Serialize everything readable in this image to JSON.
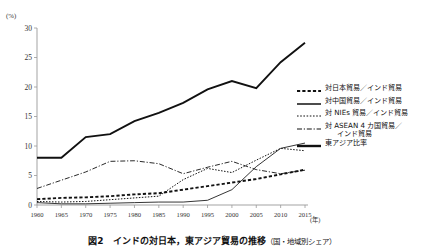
{
  "chart_data": {
    "type": "line",
    "title": "図2　インドの対日本，東アジア貿易の推移（国・地域別シェア）",
    "title_main": "図2　インドの対日本，東アジア貿易の推移",
    "title_sub": "（国・地域別シェア）",
    "xlabel": "(年)",
    "ylabel": "(%)",
    "unit_top": "(%)",
    "unit_right": "(年)",
    "grid": false,
    "legend_position": "right",
    "xlim": [
      1960,
      2015
    ],
    "ylim": [
      0,
      30
    ],
    "x": [
      1960,
      1965,
      1970,
      1975,
      1980,
      1985,
      1990,
      1995,
      2000,
      2005,
      2010,
      2015
    ],
    "xticks": [
      "1960",
      "1965",
      "1970",
      "1975",
      "1980",
      "1985",
      "1990",
      "1995",
      "2000",
      "2005",
      "2010",
      "2015"
    ],
    "yticks": [
      "0",
      "5",
      "10",
      "15",
      "20",
      "25",
      "30"
    ],
    "series": [
      {
        "name": "対日本貿易/インド貿易",
        "style": "dashed-heavy",
        "values": [
          1.0,
          1.2,
          1.3,
          1.5,
          1.8,
          2.0,
          2.6,
          3.2,
          3.8,
          4.4,
          5.2,
          6.0
        ]
      },
      {
        "name": "対中国貿易/インド貿易",
        "style": "solid-thin",
        "values": [
          0.4,
          0.2,
          0.2,
          0.3,
          0.4,
          0.5,
          0.5,
          0.8,
          2.6,
          6.5,
          9.6,
          10.5
        ]
      },
      {
        "name": "対NIEs貿易/インド貿易",
        "style": "dotted",
        "values": [
          0.6,
          0.5,
          0.6,
          0.9,
          1.2,
          1.5,
          4.3,
          6.2,
          5.5,
          7.6,
          9.6,
          9.2
        ]
      },
      {
        "name": "対ASEAN 4カ国貿易/インド貿易",
        "style": "dash-dot",
        "values": [
          2.8,
          4.2,
          5.6,
          7.4,
          7.5,
          7.0,
          5.3,
          6.4,
          7.4,
          6.0,
          5.3,
          5.9
        ]
      },
      {
        "name": "東アジア比率",
        "style": "solid-thick",
        "values": [
          8.0,
          8.0,
          11.5,
          12.0,
          14.2,
          15.6,
          17.3,
          19.6,
          21.0,
          19.8,
          24.2,
          27.5
        ]
      }
    ]
  },
  "legend": {
    "items": [
      {
        "label": "対日本貿易／インド貿易",
        "label2": ""
      },
      {
        "label": "対中国貿易／インド貿易",
        "label2": ""
      },
      {
        "label": "対 NIEs 貿易／インド貿易",
        "label2": ""
      },
      {
        "label": "対 ASEAN 4 カ国貿易／",
        "label2": "インド貿易"
      },
      {
        "label": "東アジア比率",
        "label2": ""
      }
    ]
  },
  "caption": {
    "main": "図2　インドの対日本，東アジア貿易の推移",
    "sub": "（国・地域別シェア）"
  }
}
